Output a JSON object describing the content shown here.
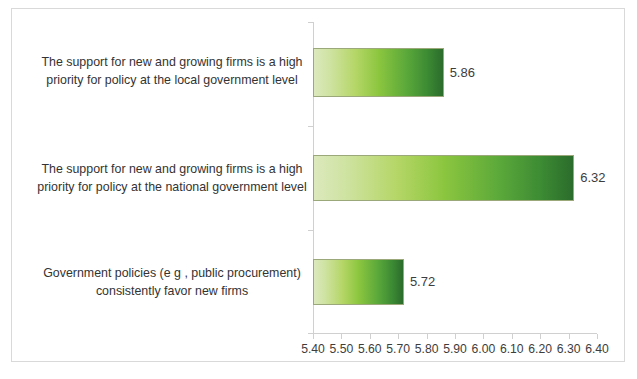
{
  "chart_data": {
    "type": "bar",
    "orientation": "horizontal",
    "title": "",
    "subtitle": "",
    "xlabel": "",
    "ylabel": "",
    "xlim": [
      5.4,
      6.4
    ],
    "xticks": [
      "5.40",
      "5.50",
      "5.60",
      "5.70",
      "5.80",
      "5.90",
      "6.00",
      "6.10",
      "6.20",
      "6.30",
      "6.40"
    ],
    "xtick_values": [
      5.4,
      5.5,
      5.6,
      5.7,
      5.8,
      5.9,
      6.0,
      6.1,
      6.2,
      6.3,
      6.4
    ],
    "grid": false,
    "legend": "none",
    "categories": [
      "The support for new and growing firms is a high priority for policy at the local government level",
      "The support for new and growing firms is a high priority for policy at the national government level",
      "Government policies (e g , public procurement) consistently favor new firms"
    ],
    "category_lines": [
      [
        "The support for new and growing firms is a high",
        "priority for policy at the local government level"
      ],
      [
        "The support for new and growing firms is a high",
        "priority for policy at the national government level"
      ],
      [
        "Government policies (e g , public procurement)",
        "consistently favor new firms"
      ]
    ],
    "values": [
      5.86,
      6.32,
      5.72
    ],
    "value_labels": [
      "5.86",
      "6.32",
      "5.72"
    ],
    "series": [
      {
        "name": "",
        "values": [
          5.86,
          6.32,
          5.72
        ]
      }
    ],
    "colors": {
      "bar_gradient_start": "#dce9bd",
      "bar_gradient_mid": "#8cc63f",
      "bar_gradient_end": "#2b6c2c",
      "bar_border": "#9aa87a",
      "axis_line": "#d0d0d0",
      "text": "#333333",
      "frame_border": "#d9d9d9",
      "background": "#ffffff"
    }
  }
}
